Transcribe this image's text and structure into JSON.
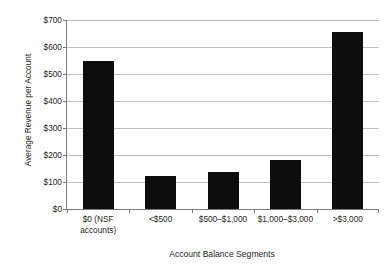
{
  "figure": {
    "cut_off_title_fragment": "",
    "background_color": "#ffffff",
    "bar_color": "#0d0d0d",
    "gridline_color": "#bfbfbf",
    "axis_color": "#7b7b7b"
  },
  "chart_data": {
    "type": "bar",
    "title": "",
    "xlabel": "Account Balance Segments",
    "ylabel": "Average Revenue per Account",
    "categories": [
      "$0 (NSF\naccounts)",
      "<$500",
      "$500–$1,000",
      "$1,000–$3,000",
      ">$3,000"
    ],
    "values": [
      550,
      122,
      138,
      180,
      655
    ],
    "ylim": [
      0,
      700
    ],
    "ytick_values": [
      0,
      100,
      200,
      300,
      400,
      500,
      600,
      700
    ],
    "ytick_labels": [
      "$0",
      "$100",
      "$200",
      "$300",
      "$400",
      "$500",
      "$600",
      "$700"
    ],
    "grid": true,
    "grid_axis": "y",
    "legend": false,
    "legend_position": "none",
    "value_prefix": "$"
  }
}
